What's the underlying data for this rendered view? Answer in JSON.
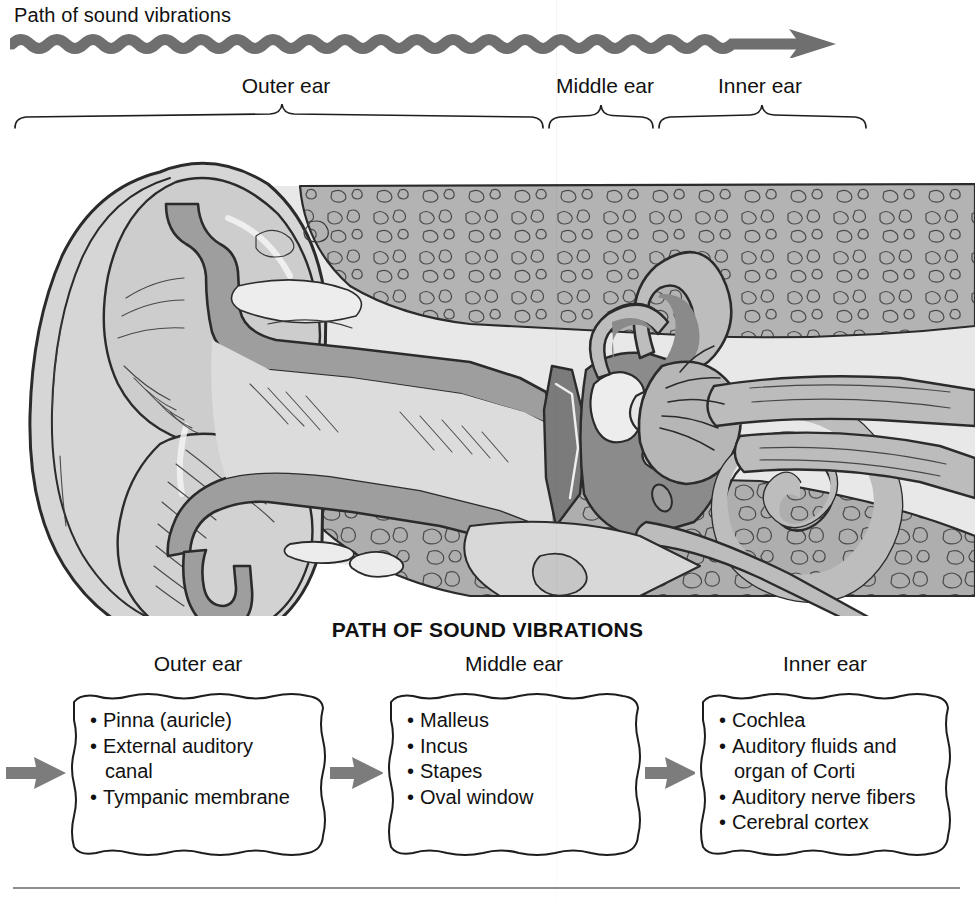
{
  "header": {
    "title": "Path of sound vibrations",
    "arrow_icon": "wavy-right-arrow"
  },
  "region_labels": {
    "outer": "Outer ear",
    "middle": "Middle ear",
    "inner": "Inner ear"
  },
  "figure": {
    "caption": "cross-section of the human ear",
    "colors": {
      "light_tissue": "#d6d6d6",
      "mid_tissue": "#b9b9b9",
      "bone_mottle": "#aeaeae",
      "dark_cavity": "#8a8a8a",
      "outline": "#2b2b2b",
      "pale": "#e9e9e9"
    }
  },
  "flowchart": {
    "title": "PATH OF SOUND VIBRATIONS",
    "arrow_icon": "solid-right-arrow",
    "arrow_color": "#7c7c7c",
    "columns": [
      {
        "header": "Outer ear",
        "items": [
          "Pinna (auricle)",
          "External auditory\ncanal",
          "Tympanic membrane"
        ]
      },
      {
        "header": "Middle ear",
        "items": [
          "Malleus",
          "Incus",
          "Stapes",
          "Oval window"
        ]
      },
      {
        "header": "Inner ear",
        "items": [
          "Cochlea",
          "Auditory fluids and\norgan of Corti",
          "Auditory nerve fibers",
          "Cerebral cortex"
        ]
      }
    ]
  }
}
